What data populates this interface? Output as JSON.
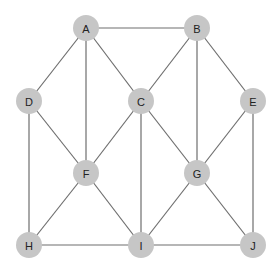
{
  "graph": {
    "node_color": "#c6c6c6",
    "edge_color": "#6e6e6e",
    "node_radius": 13,
    "nodes": [
      {
        "id": "A",
        "label": "A",
        "x": 86,
        "y": 28
      },
      {
        "id": "B",
        "label": "B",
        "x": 197,
        "y": 28
      },
      {
        "id": "D",
        "label": "D",
        "x": 29,
        "y": 101
      },
      {
        "id": "C",
        "label": "C",
        "x": 141,
        "y": 101
      },
      {
        "id": "E",
        "label": "E",
        "x": 253,
        "y": 101
      },
      {
        "id": "F",
        "label": "F",
        "x": 86,
        "y": 173
      },
      {
        "id": "G",
        "label": "G",
        "x": 197,
        "y": 173
      },
      {
        "id": "H",
        "label": "H",
        "x": 29,
        "y": 245
      },
      {
        "id": "I",
        "label": "I",
        "x": 141,
        "y": 245
      },
      {
        "id": "J",
        "label": "J",
        "x": 253,
        "y": 245
      }
    ],
    "edges": [
      [
        "A",
        "B"
      ],
      [
        "A",
        "D"
      ],
      [
        "A",
        "C"
      ],
      [
        "A",
        "F"
      ],
      [
        "B",
        "C"
      ],
      [
        "B",
        "G"
      ],
      [
        "B",
        "E"
      ],
      [
        "D",
        "F"
      ],
      [
        "D",
        "H"
      ],
      [
        "C",
        "F"
      ],
      [
        "C",
        "G"
      ],
      [
        "C",
        "I"
      ],
      [
        "E",
        "G"
      ],
      [
        "E",
        "J"
      ],
      [
        "F",
        "H"
      ],
      [
        "F",
        "I"
      ],
      [
        "G",
        "I"
      ],
      [
        "G",
        "J"
      ],
      [
        "H",
        "I"
      ],
      [
        "I",
        "J"
      ]
    ]
  }
}
